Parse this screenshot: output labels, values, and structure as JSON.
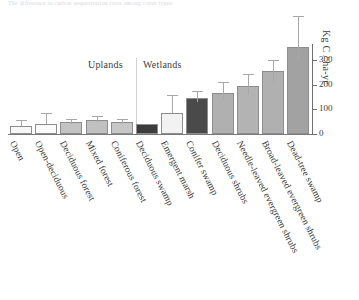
{
  "figure": {
    "top_caption": "The difference in carbon sequestration rates among cover types"
  },
  "chart_data": {
    "type": "bar",
    "title": "",
    "xlabel": "",
    "ylabel": "Kg C / ha-yr",
    "ylim": [
      0,
      400
    ],
    "yticks": [
      0,
      100,
      200,
      300
    ],
    "ytick_labels": [
      "0",
      "100",
      "200",
      "300"
    ],
    "grid": false,
    "legend": false,
    "axis_position": "right",
    "group_labels": [
      {
        "label": "Uplands",
        "start_index": 0,
        "end_index": 4
      },
      {
        "label": "Wetlands",
        "start_index": 5,
        "end_index": 11
      }
    ],
    "categories": [
      "Open",
      "Open-deciduous",
      "Deciduous forest",
      "Mixed forest",
      "Coniferous forest",
      "Deciduous swamp",
      "Emergent marsh",
      "Conifer swamp",
      "Deciduous shrubs",
      "Needle-leaved evergreen shrubs",
      "Broad-leaved evergreen shrubs",
      "Dead-tree swamp"
    ],
    "values": [
      33,
      40,
      49,
      57,
      49,
      41,
      85,
      148,
      168,
      196,
      256,
      356
    ],
    "err_low": [
      33,
      40,
      42,
      48,
      42,
      41,
      85,
      130,
      140,
      160,
      210,
      300
    ],
    "err_high": [
      55,
      85,
      62,
      72,
      63,
      41,
      160,
      175,
      212,
      245,
      300,
      482
    ],
    "bar_colors": [
      "#f7f7f7",
      "#fbfbfb",
      "#c3c3c3",
      "#c0c0c0",
      "#c6c6c6",
      "#3c3c3c",
      "#f2f2f2",
      "#4a4a4a",
      "#b0b0b0",
      "#b3b3b3",
      "#b0b0b0",
      "#a2a2a2"
    ]
  }
}
